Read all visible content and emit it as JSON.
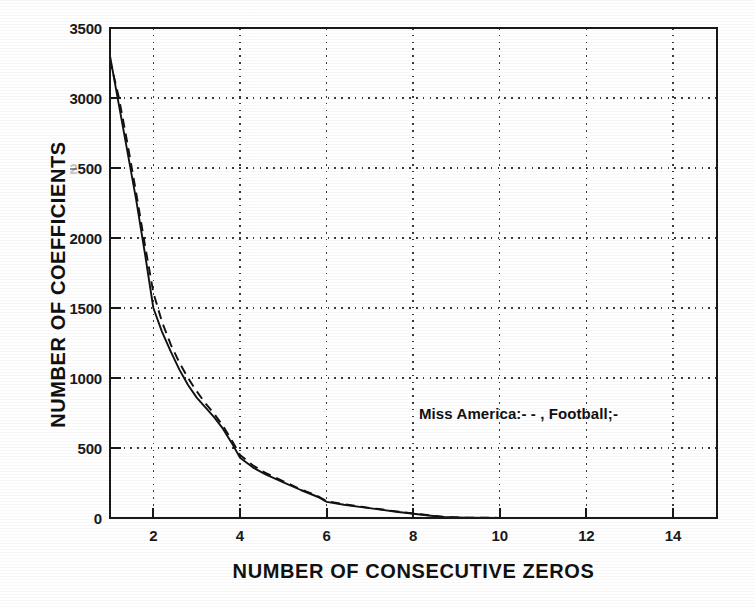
{
  "chart_data": {
    "type": "line",
    "title": "",
    "subtitle": "",
    "xlabel": "NUMBER OF CONSECUTIVE ZEROS",
    "ylabel": "NUMBER OF COEFFICIENTS",
    "xlim": [
      1,
      15
    ],
    "ylim": [
      0,
      3500
    ],
    "xticks": [
      2,
      4,
      6,
      8,
      10,
      12,
      14
    ],
    "xtick_labels": [
      "2",
      "4",
      "6",
      "8",
      "10",
      "12",
      "14"
    ],
    "yticks": [
      0,
      500,
      1000,
      1500,
      2000,
      2500,
      3000,
      3500
    ],
    "ytick_labels": [
      "0",
      "500",
      "1000",
      "1500",
      "2000",
      "2500",
      "3000",
      "3500"
    ],
    "grid": true,
    "grid_style": "dotted",
    "legend_position": "inside-right",
    "annotation": "Miss America:- - , Football;-",
    "line_color": "#111111",
    "grid_color": "#444444",
    "axis_color": "#1a1a1a",
    "background_color": "#ffffff",
    "x": [
      1,
      1.2,
      1.4,
      1.6,
      1.8,
      2,
      2.2,
      2.4,
      2.6,
      2.8,
      3,
      3.2,
      3.4,
      3.6,
      3.8,
      4,
      4.3,
      4.6,
      5,
      5.4,
      5.8,
      6,
      6.4,
      6.8,
      7.2,
      7.6,
      8,
      8.4,
      8.7,
      9.2,
      10,
      11,
      12,
      13,
      14,
      15
    ],
    "series": [
      {
        "name": "Football",
        "dash": "solid",
        "label_marker": "-",
        "values": [
          3300,
          2960,
          2620,
          2280,
          1900,
          1500,
          1330,
          1190,
          1060,
          950,
          860,
          790,
          720,
          640,
          540,
          430,
          360,
          310,
          255,
          200,
          150,
          115,
          95,
          78,
          62,
          45,
          30,
          16,
          7,
          3,
          1,
          0,
          0,
          0,
          0,
          0
        ]
      },
      {
        "name": "Miss America",
        "dash": "dashed",
        "label_marker": "- -",
        "values": [
          3270,
          3010,
          2680,
          2330,
          1960,
          1610,
          1400,
          1240,
          1110,
          1000,
          905,
          820,
          745,
          660,
          560,
          450,
          375,
          320,
          262,
          205,
          155,
          120,
          98,
          80,
          64,
          47,
          32,
          18,
          8,
          3,
          1,
          0,
          0,
          0,
          0,
          0
        ]
      }
    ]
  },
  "axes": {
    "x_title": "NUMBER OF CONSECUTIVE ZEROS",
    "y_title": "NUMBER OF COEFFICIENTS",
    "y_labels": [
      "3500",
      "3000",
      "2500",
      "2000",
      "1500",
      "1000",
      "500",
      "0"
    ],
    "x_labels": [
      "2",
      "4",
      "6",
      "8",
      "10",
      "12",
      "14"
    ]
  },
  "legend": {
    "text": "Miss America:- - , Football;-",
    "entries": [
      {
        "name": "Miss America",
        "style": "- -"
      },
      {
        "name": "Football",
        "style": "-"
      }
    ]
  }
}
